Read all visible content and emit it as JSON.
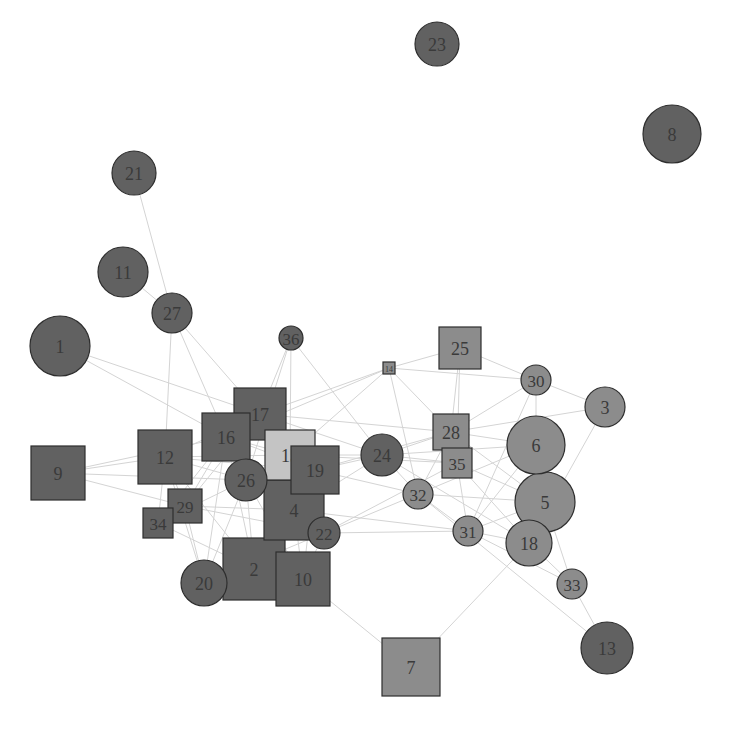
{
  "diagram": {
    "type": "network-graph",
    "colors": {
      "dark": "#616161",
      "medium": "#8c8c8c",
      "light": "#c4c4c4",
      "edge": "#d4d4d4",
      "stroke": "#2e2e2e"
    },
    "nodes": [
      {
        "id": "1",
        "shape": "circle",
        "x": 60,
        "y": 346,
        "size": 30,
        "color": "dark"
      },
      {
        "id": "2",
        "shape": "square",
        "x": 254,
        "y": 569,
        "size": 31,
        "color": "dark"
      },
      {
        "id": "3",
        "shape": "circle",
        "x": 605,
        "y": 407,
        "size": 20,
        "color": "medium"
      },
      {
        "id": "4",
        "shape": "square",
        "x": 294,
        "y": 510,
        "size": 30,
        "color": "dark"
      },
      {
        "id": "5",
        "shape": "circle",
        "x": 545,
        "y": 502,
        "size": 30,
        "color": "medium"
      },
      {
        "id": "6",
        "shape": "circle",
        "x": 536,
        "y": 445,
        "size": 29,
        "color": "medium"
      },
      {
        "id": "7",
        "shape": "square",
        "x": 411,
        "y": 667,
        "size": 29,
        "color": "medium"
      },
      {
        "id": "8",
        "shape": "circle",
        "x": 672,
        "y": 134,
        "size": 29,
        "color": "dark"
      },
      {
        "id": "9",
        "shape": "square",
        "x": 58,
        "y": 473,
        "size": 27,
        "color": "dark"
      },
      {
        "id": "10",
        "shape": "square",
        "x": 303,
        "y": 579,
        "size": 27,
        "color": "dark"
      },
      {
        "id": "11",
        "shape": "circle",
        "x": 123,
        "y": 272,
        "size": 25,
        "color": "dark"
      },
      {
        "id": "12",
        "shape": "square",
        "x": 165,
        "y": 457,
        "size": 27,
        "color": "dark"
      },
      {
        "id": "13",
        "shape": "circle",
        "x": 607,
        "y": 648,
        "size": 26,
        "color": "dark"
      },
      {
        "id": "14",
        "shape": "square",
        "x": 389,
        "y": 368,
        "size": 6,
        "color": "medium"
      },
      {
        "id": "15",
        "shape": "square",
        "x": 290,
        "y": 455,
        "size": 25,
        "color": "light"
      },
      {
        "id": "16",
        "shape": "square",
        "x": 226,
        "y": 437,
        "size": 24,
        "color": "dark"
      },
      {
        "id": "17",
        "shape": "square",
        "x": 260,
        "y": 414,
        "size": 26,
        "color": "dark"
      },
      {
        "id": "18",
        "shape": "circle",
        "x": 529,
        "y": 543,
        "size": 23,
        "color": "medium"
      },
      {
        "id": "19",
        "shape": "square",
        "x": 315,
        "y": 470,
        "size": 24,
        "color": "dark"
      },
      {
        "id": "20",
        "shape": "circle",
        "x": 204,
        "y": 583,
        "size": 23,
        "color": "dark"
      },
      {
        "id": "21",
        "shape": "circle",
        "x": 134,
        "y": 173,
        "size": 22,
        "color": "dark"
      },
      {
        "id": "22",
        "shape": "circle",
        "x": 324,
        "y": 533,
        "size": 16,
        "color": "dark"
      },
      {
        "id": "23",
        "shape": "circle",
        "x": 437,
        "y": 44,
        "size": 22,
        "color": "dark"
      },
      {
        "id": "24",
        "shape": "circle",
        "x": 382,
        "y": 455,
        "size": 21,
        "color": "dark"
      },
      {
        "id": "25",
        "shape": "square",
        "x": 460,
        "y": 348,
        "size": 21,
        "color": "medium"
      },
      {
        "id": "26",
        "shape": "circle",
        "x": 246,
        "y": 480,
        "size": 21,
        "color": "dark"
      },
      {
        "id": "27",
        "shape": "circle",
        "x": 172,
        "y": 313,
        "size": 20,
        "color": "dark"
      },
      {
        "id": "28",
        "shape": "square",
        "x": 451,
        "y": 432,
        "size": 18,
        "color": "medium"
      },
      {
        "id": "29",
        "shape": "square",
        "x": 185,
        "y": 506,
        "size": 17,
        "color": "dark"
      },
      {
        "id": "30",
        "shape": "circle",
        "x": 536,
        "y": 380,
        "size": 15,
        "color": "medium"
      },
      {
        "id": "31",
        "shape": "circle",
        "x": 468,
        "y": 531,
        "size": 15,
        "color": "medium"
      },
      {
        "id": "32",
        "shape": "circle",
        "x": 418,
        "y": 494,
        "size": 15,
        "color": "medium"
      },
      {
        "id": "33",
        "shape": "circle",
        "x": 572,
        "y": 584,
        "size": 15,
        "color": "medium"
      },
      {
        "id": "34",
        "shape": "square",
        "x": 158,
        "y": 523,
        "size": 15,
        "color": "dark"
      },
      {
        "id": "35",
        "shape": "square",
        "x": 457,
        "y": 463,
        "size": 15,
        "color": "medium"
      },
      {
        "id": "36",
        "shape": "circle",
        "x": 291,
        "y": 338,
        "size": 12,
        "color": "dark"
      }
    ],
    "edges": [
      [
        "21",
        "27"
      ],
      [
        "11",
        "27"
      ],
      [
        "27",
        "16"
      ],
      [
        "27",
        "17"
      ],
      [
        "27",
        "12"
      ],
      [
        "1",
        "17"
      ],
      [
        "1",
        "16"
      ],
      [
        "9",
        "12"
      ],
      [
        "9",
        "16"
      ],
      [
        "9",
        "29"
      ],
      [
        "9",
        "26"
      ],
      [
        "36",
        "17"
      ],
      [
        "36",
        "15"
      ],
      [
        "36",
        "24"
      ],
      [
        "36",
        "26"
      ],
      [
        "14",
        "17"
      ],
      [
        "14",
        "16"
      ],
      [
        "14",
        "25"
      ],
      [
        "14",
        "30"
      ],
      [
        "14",
        "28"
      ],
      [
        "14",
        "32"
      ],
      [
        "14",
        "15"
      ],
      [
        "25",
        "30"
      ],
      [
        "25",
        "28"
      ],
      [
        "25",
        "35"
      ],
      [
        "30",
        "3"
      ],
      [
        "30",
        "6"
      ],
      [
        "30",
        "28"
      ],
      [
        "30",
        "31"
      ],
      [
        "3",
        "28"
      ],
      [
        "3",
        "18"
      ],
      [
        "6",
        "28"
      ],
      [
        "6",
        "24"
      ],
      [
        "6",
        "32"
      ],
      [
        "6",
        "31"
      ],
      [
        "5",
        "28"
      ],
      [
        "5",
        "32"
      ],
      [
        "5",
        "31"
      ],
      [
        "5",
        "35"
      ],
      [
        "18",
        "31"
      ],
      [
        "18",
        "24"
      ],
      [
        "18",
        "7"
      ],
      [
        "18",
        "33"
      ],
      [
        "18",
        "35"
      ],
      [
        "33",
        "13"
      ],
      [
        "33",
        "31"
      ],
      [
        "33",
        "5"
      ],
      [
        "13",
        "32"
      ],
      [
        "31",
        "4"
      ],
      [
        "31",
        "22"
      ],
      [
        "31",
        "32"
      ],
      [
        "31",
        "35"
      ],
      [
        "32",
        "24"
      ],
      [
        "32",
        "19"
      ],
      [
        "32",
        "28"
      ],
      [
        "32",
        "20"
      ],
      [
        "24",
        "19"
      ],
      [
        "24",
        "15"
      ],
      [
        "24",
        "28"
      ],
      [
        "24",
        "35"
      ],
      [
        "24",
        "4"
      ],
      [
        "28",
        "17"
      ],
      [
        "28",
        "19"
      ],
      [
        "35",
        "22"
      ],
      [
        "35",
        "15"
      ],
      [
        "7",
        "10"
      ],
      [
        "10",
        "22"
      ],
      [
        "10",
        "4"
      ],
      [
        "2",
        "20"
      ],
      [
        "2",
        "4"
      ],
      [
        "2",
        "26"
      ],
      [
        "2",
        "16"
      ],
      [
        "2",
        "12"
      ],
      [
        "2",
        "34"
      ],
      [
        "20",
        "16"
      ],
      [
        "20",
        "12"
      ],
      [
        "20",
        "26"
      ],
      [
        "20",
        "29"
      ],
      [
        "29",
        "12"
      ],
      [
        "29",
        "16"
      ],
      [
        "29",
        "17"
      ],
      [
        "29",
        "4"
      ],
      [
        "29",
        "22"
      ],
      [
        "34",
        "12"
      ],
      [
        "34",
        "16"
      ],
      [
        "34",
        "26"
      ],
      [
        "12",
        "17"
      ],
      [
        "12",
        "15"
      ],
      [
        "12",
        "26"
      ],
      [
        "12",
        "19"
      ],
      [
        "16",
        "17"
      ],
      [
        "16",
        "15"
      ],
      [
        "16",
        "19"
      ],
      [
        "16",
        "4"
      ],
      [
        "17",
        "15"
      ],
      [
        "17",
        "19"
      ],
      [
        "17",
        "4"
      ],
      [
        "17",
        "24"
      ],
      [
        "15",
        "19"
      ],
      [
        "15",
        "26"
      ],
      [
        "15",
        "4"
      ],
      [
        "19",
        "4"
      ],
      [
        "19",
        "22"
      ],
      [
        "26",
        "4"
      ],
      [
        "26",
        "10"
      ],
      [
        "22",
        "4"
      ],
      [
        "22",
        "17"
      ],
      [
        "10",
        "19"
      ]
    ]
  }
}
